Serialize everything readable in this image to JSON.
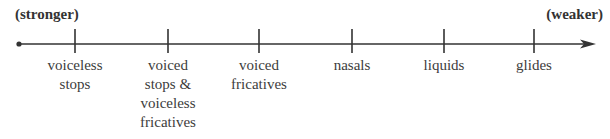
{
  "diagram": {
    "start_label": "(stronger)",
    "end_label": "(weaker)",
    "axis": {
      "start_x": 19,
      "end_x": 596,
      "y": 44,
      "color": "#333333"
    },
    "ticks": [
      {
        "x": 75,
        "lines": [
          "voiceless",
          "stops"
        ]
      },
      {
        "x": 168,
        "lines": [
          "voiced",
          "stops &",
          "voiceless",
          "fricatives"
        ]
      },
      {
        "x": 259,
        "lines": [
          "voiced",
          "fricatives"
        ]
      },
      {
        "x": 352,
        "lines": [
          "nasals"
        ]
      },
      {
        "x": 444,
        "lines": [
          "liquids"
        ]
      },
      {
        "x": 534,
        "lines": [
          "glides"
        ]
      }
    ]
  }
}
